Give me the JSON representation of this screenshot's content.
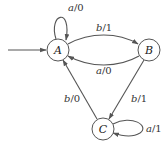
{
  "diagram": {
    "type": "finite-state-machine",
    "initial_state": "A",
    "states": [
      {
        "id": "A",
        "label": "A"
      },
      {
        "id": "B",
        "label": "B"
      },
      {
        "id": "C",
        "label": "C"
      }
    ],
    "transitions": [
      {
        "from": "A",
        "to": "A",
        "input": "a",
        "sep": "/",
        "output": "0"
      },
      {
        "from": "A",
        "to": "B",
        "input": "b",
        "sep": "/",
        "output": "1"
      },
      {
        "from": "B",
        "to": "A",
        "input": "a",
        "sep": "/",
        "output": "0"
      },
      {
        "from": "C",
        "to": "A",
        "input": "b",
        "sep": "/",
        "output": "0"
      },
      {
        "from": "B",
        "to": "C",
        "input": "b",
        "sep": "/",
        "output": "1"
      },
      {
        "from": "C",
        "to": "C",
        "input": "a",
        "sep": "/",
        "output": "1"
      }
    ],
    "colors": {
      "stroke": "#555555",
      "text": "#222222",
      "background": "#ffffff"
    }
  }
}
